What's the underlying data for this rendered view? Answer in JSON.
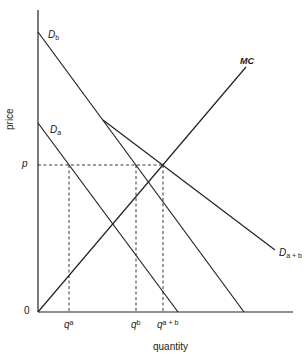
{
  "diagram": {
    "axes": {
      "x_label": "quantity",
      "y_label": "price",
      "origin_label": "0"
    },
    "curves": {
      "Db": {
        "label_main": "D",
        "label_sub": "b"
      },
      "Da": {
        "label_main": "D",
        "label_sub": "a"
      },
      "Dab": {
        "label_main": "D",
        "label_sub": "a + b"
      },
      "MC": {
        "label": "MC"
      }
    },
    "price_marker": {
      "label": "p"
    },
    "quantity_markers": [
      {
        "main": "q",
        "sup": "a"
      },
      {
        "main": "q",
        "sup": "b"
      },
      {
        "main": "q",
        "sup": "a + b"
      }
    ]
  }
}
